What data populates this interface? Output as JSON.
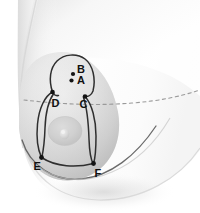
{
  "figure": {
    "background_color": "#ffffff",
    "skin_light": "#fdfdfd",
    "skin_mid": "#e8e8e8",
    "skin_shadow": "#bdbdbd",
    "outline_color": "#3a3a3a",
    "dashed_color": "#9a9a9a",
    "dot_color": "#141414",
    "label_color": "#111111",
    "areola_color": "#cfcfcf",
    "nipple_color": "#dedede"
  },
  "points": [
    {
      "id": "A",
      "label": "A",
      "dot_x": 71.5,
      "dot_y": 80.5,
      "label_x": 77,
      "label_y": 83.5,
      "dot_r": 2.1
    },
    {
      "id": "B",
      "label": "B",
      "dot_x": 73.0,
      "dot_y": 74.0,
      "label_x": 77,
      "label_y": 72.5,
      "dot_r": 2.1
    },
    {
      "id": "C",
      "label": "C",
      "dot_x": 85.0,
      "dot_y": 96.5,
      "label_x": 79.5,
      "label_y": 108.0,
      "dot_r": 2.3
    },
    {
      "id": "D",
      "label": "D",
      "dot_x": 52.5,
      "dot_y": 92.0,
      "label_x": 51.5,
      "label_y": 106.5,
      "dot_r": 2.3
    },
    {
      "id": "E",
      "label": "E",
      "dot_x": 41.5,
      "dot_y": 157.5,
      "label_x": 33.5,
      "label_y": 170.0,
      "dot_r": 2.4
    },
    {
      "id": "F",
      "label": "F",
      "dot_x": 93.5,
      "dot_y": 163.5,
      "label_x": 94.5,
      "label_y": 177.0,
      "dot_r": 2.4
    }
  ],
  "curves": {
    "areola_center_x": 65,
    "areola_center_y": 131,
    "areola_rx": 17,
    "areola_ry": 14.5,
    "nipple_cx": 64.5,
    "nipple_cy": 134.5,
    "nipple_r": 4.5
  }
}
